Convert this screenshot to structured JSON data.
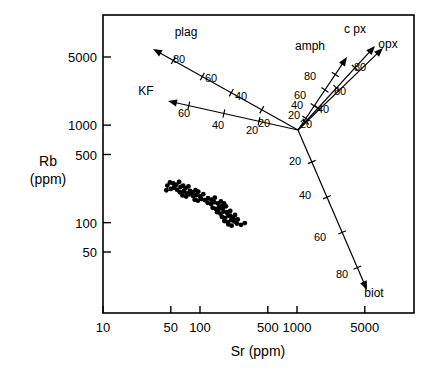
{
  "chart_data": {
    "type": "scatter",
    "title": "",
    "xlabel": "Sr (ppm)",
    "ylabel": "Rb\n(ppm)",
    "ylabel_line1": "Rb",
    "ylabel_line2": "(ppm)",
    "xscale": "log",
    "yscale": "log",
    "xlim": [
      10,
      12500
    ],
    "ylim": [
      20,
      12000
    ],
    "grid": false,
    "legend": "none",
    "xticks": [
      10,
      50,
      100,
      500,
      1000,
      5000
    ],
    "xtick_labels": [
      "10",
      "50",
      "100",
      "500",
      "1000",
      "5000"
    ],
    "yticks": [
      50,
      100,
      500,
      1000,
      5000
    ],
    "ytick_labels": [
      "50",
      "100",
      "500",
      "1000",
      "5000"
    ],
    "points": [
      [
        46,
        240
      ],
      [
        49,
        258
      ],
      [
        53,
        252
      ],
      [
        57,
        245
      ],
      [
        61,
        262
      ],
      [
        45,
        215
      ],
      [
        50,
        222
      ],
      [
        54,
        228
      ],
      [
        58,
        218
      ],
      [
        63,
        232
      ],
      [
        67,
        240
      ],
      [
        71,
        225
      ],
      [
        76,
        235
      ],
      [
        62,
        205
      ],
      [
        68,
        210
      ],
      [
        73,
        200
      ],
      [
        79,
        212
      ],
      [
        84,
        205
      ],
      [
        90,
        215
      ],
      [
        96,
        208
      ],
      [
        66,
        190
      ],
      [
        72,
        185
      ],
      [
        78,
        195
      ],
      [
        85,
        188
      ],
      [
        92,
        192
      ],
      [
        100,
        186
      ],
      [
        108,
        196
      ],
      [
        88,
        172
      ],
      [
        95,
        168
      ],
      [
        103,
        175
      ],
      [
        112,
        170
      ],
      [
        121,
        178
      ],
      [
        131,
        172
      ],
      [
        142,
        180
      ],
      [
        120,
        160
      ],
      [
        130,
        155
      ],
      [
        140,
        162
      ],
      [
        152,
        158
      ],
      [
        164,
        165
      ],
      [
        177,
        158
      ],
      [
        135,
        142
      ],
      [
        146,
        138
      ],
      [
        158,
        145
      ],
      [
        171,
        140
      ],
      [
        185,
        147
      ],
      [
        150,
        128
      ],
      [
        162,
        124
      ],
      [
        175,
        130
      ],
      [
        190,
        126
      ],
      [
        205,
        132
      ],
      [
        168,
        115
      ],
      [
        182,
        112
      ],
      [
        197,
        118
      ],
      [
        213,
        114
      ],
      [
        230,
        120
      ],
      [
        178,
        104
      ],
      [
        193,
        101
      ],
      [
        209,
        106
      ],
      [
        226,
        103
      ],
      [
        245,
        108
      ],
      [
        196,
        96
      ],
      [
        212,
        93
      ],
      [
        240,
        98
      ],
      [
        265,
        95
      ],
      [
        290,
        99
      ],
      [
        168,
        148
      ],
      [
        155,
        136
      ],
      [
        205,
        118
      ],
      [
        222,
        110
      ],
      [
        188,
        128
      ]
    ],
    "point_count": 70,
    "vectors": [
      {
        "name": "plag",
        "label": "plag",
        "label_x": 186,
        "label_y": 36,
        "from_px": [
          298,
          130
        ],
        "to_px": [
          153,
          49
        ],
        "tick_labels": [
          "20",
          "40",
          "60",
          "80"
        ],
        "ticks": [
          {
            "value": "20",
            "t": 0.25,
            "lx": 264,
            "ly": 127
          },
          {
            "value": "40",
            "t": 0.46,
            "lx": 241,
            "ly": 100
          },
          {
            "value": "60",
            "t": 0.66,
            "lx": 211,
            "ly": 82
          },
          {
            "value": "80",
            "t": 0.86,
            "lx": 179,
            "ly": 63
          }
        ]
      },
      {
        "name": "KF",
        "label": "KF",
        "label_x": 146,
        "label_y": 95,
        "from_px": [
          298,
          130
        ],
        "to_px": [
          168,
          101
        ],
        "tick_labels": [
          "20",
          "40",
          "60"
        ],
        "ticks": [
          {
            "value": "20",
            "t": 0.3,
            "lx": 252,
            "ly": 134
          },
          {
            "value": "40",
            "t": 0.57,
            "lx": 218,
            "ly": 129
          },
          {
            "value": "60",
            "t": 0.84,
            "lx": 184,
            "ly": 117
          }
        ]
      },
      {
        "name": "amph",
        "label": "amph",
        "label_x": 310,
        "label_y": 50,
        "from_px": [
          298,
          130
        ],
        "to_px": [
          347,
          57
        ],
        "tick_labels": [
          "20",
          "40",
          "60",
          "80"
        ],
        "ticks": [
          {
            "value": "20",
            "t": 0.16,
            "lx": 294,
            "ly": 119
          },
          {
            "value": "40",
            "t": 0.33,
            "lx": 297,
            "ly": 109
          },
          {
            "value": "60",
            "t": 0.55,
            "lx": 300,
            "ly": 99
          },
          {
            "value": "80",
            "t": 0.76,
            "lx": 310,
            "ly": 80
          }
        ]
      },
      {
        "name": "cpx",
        "label": "c px",
        "label_x": 355,
        "label_y": 33,
        "from_px": [
          298,
          130
        ],
        "to_px": [
          375,
          46
        ],
        "tick_labels": [
          "20",
          "40",
          "60",
          "80"
        ],
        "ticks": [
          {
            "value": "20",
            "t": 0.1,
            "lx": 306,
            "ly": 128
          },
          {
            "value": "40",
            "t": 0.26,
            "lx": 323,
            "ly": 113
          },
          {
            "value": "60",
            "t": 0.5,
            "lx": 340,
            "ly": 95
          },
          {
            "value": "80",
            "t": 0.74,
            "lx": 360,
            "ly": 71
          }
        ]
      },
      {
        "name": "opx",
        "label": "opx",
        "label_x": 388,
        "label_y": 48,
        "from_px": [
          298,
          130
        ],
        "to_px": [
          383,
          48
        ],
        "tick_labels": [],
        "ticks": []
      },
      {
        "name": "biot",
        "label": "biot",
        "label_x": 374,
        "label_y": 297,
        "from_px": [
          298,
          130
        ],
        "to_px": [
          367,
          290
        ],
        "tick_labels": [
          "20",
          "40",
          "60",
          "80"
        ],
        "ticks": [
          {
            "value": "20",
            "t": 0.2,
            "lx": 295,
            "ly": 165
          },
          {
            "value": "40",
            "t": 0.42,
            "lx": 305,
            "ly": 199
          },
          {
            "value": "60",
            "t": 0.64,
            "lx": 320,
            "ly": 241
          },
          {
            "value": "80",
            "t": 0.86,
            "lx": 342,
            "ly": 278
          }
        ]
      }
    ]
  },
  "axes": {
    "x_title": "Sr (ppm)",
    "y_title_line1": "Rb",
    "y_title_line2": "(ppm)"
  }
}
